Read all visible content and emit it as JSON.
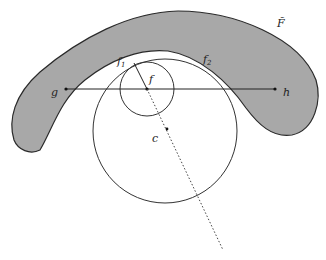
{
  "figure": {
    "type": "geometric-diagram",
    "colors": {
      "region_fill": "#a8a8a8",
      "stroke": "#2a2a2a",
      "background": "#ffffff"
    },
    "labels": {
      "region": "F̃",
      "f1": "f",
      "f1_sub": "1",
      "f2": "f",
      "f2_sub": "2",
      "f": "f",
      "g": "g",
      "h": "h",
      "c": "c"
    },
    "elements": {
      "shaded_region": "curved band F̃",
      "small_circle": {
        "cx": 147,
        "cy": 89,
        "r": 27
      },
      "large_circle": {
        "cx": 165,
        "cy": 131,
        "r": 72
      },
      "segment_gh": {
        "x1": 66,
        "y1": 89,
        "x2": 275,
        "y2": 89
      },
      "dotted_ray": {
        "x1": 147,
        "y1": 89,
        "x2": 223,
        "y2": 250
      },
      "radius_segment": {
        "x1": 147,
        "y1": 89,
        "x2": 134,
        "y2": 63
      }
    }
  }
}
